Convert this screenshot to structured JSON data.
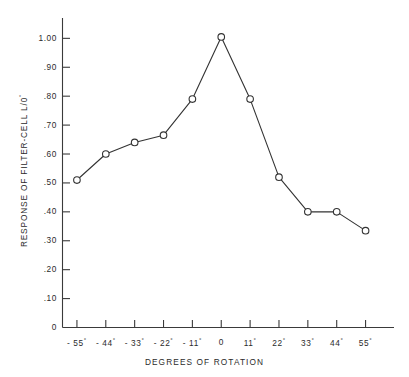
{
  "chart_data": {
    "type": "line",
    "title": "",
    "xlabel": "DEGREES OF ROTATION",
    "ylabel": "RESPONSE OF FILTER-CELL L/0°",
    "ylabel_main": "RESPONSE OF FILTER-CELL L/0",
    "ylabel_sup": "°",
    "x": [
      -55,
      -44,
      -33,
      -22,
      -11,
      0,
      11,
      22,
      33,
      44,
      55
    ],
    "categories": [
      "-55°",
      "-44°",
      "-33°",
      "-22°",
      "-11°",
      "0",
      "11°",
      "22°",
      "33°",
      "44°",
      "55°"
    ],
    "values": [
      0.51,
      0.6,
      0.64,
      0.665,
      0.79,
      1.005,
      0.79,
      0.52,
      0.4,
      0.4,
      0.335
    ],
    "series": [
      {
        "name": "Response of filter-cell L/0°",
        "values": [
          0.51,
          0.6,
          0.64,
          0.665,
          0.79,
          1.005,
          0.79,
          0.52,
          0.4,
          0.4,
          0.335
        ]
      }
    ],
    "xlim": [
      -60.5,
      60.5
    ],
    "ylim": [
      0,
      1.06
    ],
    "grid": false,
    "legend": "none",
    "marker": "open-circle",
    "line_color": "#333333",
    "marker_edge_color": "#333333",
    "marker_face_color": "#ffffff"
  },
  "axes": {
    "y_ticks": [
      {
        "value": 1.0,
        "label": "1.00"
      },
      {
        "value": 0.9,
        "label": ".90"
      },
      {
        "value": 0.8,
        "label": ".80"
      },
      {
        "value": 0.7,
        "label": ".70"
      },
      {
        "value": 0.6,
        "label": ".60"
      },
      {
        "value": 0.5,
        "label": ".50"
      },
      {
        "value": 0.4,
        "label": ".40"
      },
      {
        "value": 0.3,
        "label": ".30"
      },
      {
        "value": 0.2,
        "label": ".20"
      },
      {
        "value": 0.1,
        "label": ".10"
      },
      {
        "value": 0.0,
        "label": "0"
      }
    ],
    "x_ticks": [
      {
        "value": -55,
        "num": "- 55",
        "sup": "°"
      },
      {
        "value": -44,
        "num": "- 44",
        "sup": "°"
      },
      {
        "value": -33,
        "num": "- 33",
        "sup": "°"
      },
      {
        "value": -22,
        "num": "- 22",
        "sup": "°"
      },
      {
        "value": -11,
        "num": "- 11",
        "sup": "°"
      },
      {
        "value": 0,
        "num": "0",
        "sup": ""
      },
      {
        "value": 11,
        "num": "11",
        "sup": "°"
      },
      {
        "value": 22,
        "num": "22",
        "sup": "°"
      },
      {
        "value": 33,
        "num": "33",
        "sup": "°"
      },
      {
        "value": 44,
        "num": "44",
        "sup": "°"
      },
      {
        "value": 55,
        "num": "55",
        "sup": "°"
      }
    ]
  }
}
